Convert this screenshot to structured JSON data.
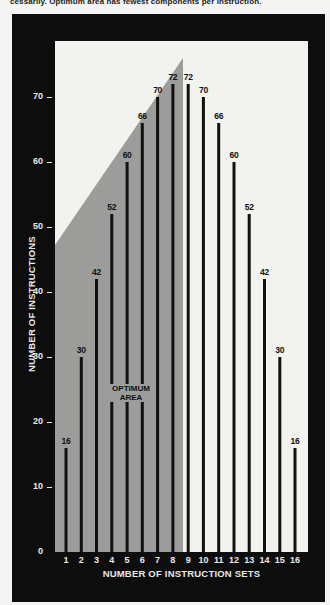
{
  "caption": "cessarily. Optimum area has fewest components per instruction.",
  "colors": {
    "frame": "#0d0d0d",
    "plot_background": "#f2f2ef",
    "optimum_area": "#9c9c9a",
    "bars": "#111111",
    "axis_text": "#e8e8e8"
  },
  "chart_data": {
    "type": "bar",
    "title": "",
    "xlabel": "NUMBER OF INSTRUCTION SETS",
    "ylabel": "NUMBER OF INSTRUCTIONS",
    "categories": [
      "1",
      "2",
      "3",
      "4",
      "5",
      "6",
      "7",
      "8",
      "9",
      "10",
      "11",
      "12",
      "13",
      "14",
      "15",
      "16"
    ],
    "values": [
      16,
      30,
      42,
      52,
      60,
      66,
      70,
      72,
      72,
      70,
      66,
      60,
      52,
      42,
      30,
      16
    ],
    "data_labels": [
      "16",
      "30",
      "42",
      "52",
      "60",
      "66",
      "70",
      "72",
      "72",
      "70",
      "66",
      "60",
      "52",
      "42",
      "30",
      "16"
    ],
    "yticks": [
      "0",
      "10",
      "20",
      "30",
      "40",
      "50",
      "60",
      "70"
    ],
    "ylim": [
      0,
      78
    ],
    "grid": false,
    "legend": null,
    "annotations": [
      {
        "text": "OPTIMUM AREA",
        "region": "shaded triangle-topped area covering instruction sets 1 through 8"
      }
    ]
  }
}
